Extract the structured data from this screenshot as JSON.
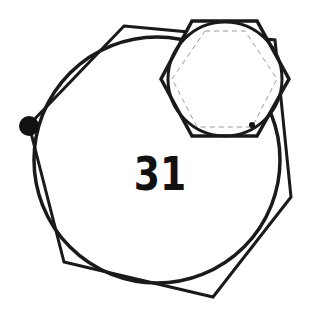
{
  "diagram": {
    "number_label": "31",
    "colors": {
      "stroke": "#1a1a1a",
      "dashed": "#9a9a9a",
      "background": "#ffffff"
    },
    "big_hexagon": {
      "points": "124,26 275,40 291,197 213,297 64,262 29,125"
    },
    "big_circle": {
      "cx": 157,
      "cy": 160,
      "r": 123
    },
    "large_dot": {
      "cx": 29,
      "cy": 126,
      "r": 10
    },
    "small_hexagon": {
      "points": "192,21 257,21 289,79 257,136 192,136 161,79"
    },
    "small_circle": {
      "cx": 225,
      "cy": 79,
      "r": 57
    },
    "dashed_hexagon": {
      "points": "205,31 245,31 277,79 252,127 197,127 172,79"
    },
    "small_dot": {
      "cx": 252,
      "cy": 125,
      "r": 3
    }
  }
}
